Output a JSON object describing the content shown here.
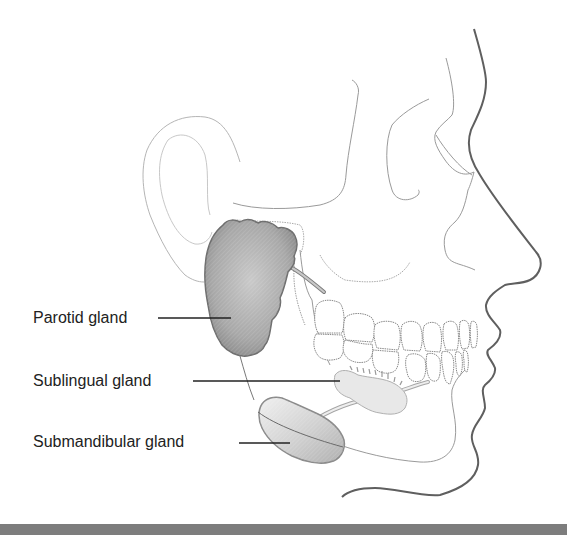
{
  "figure": {
    "labels": [
      {
        "id": "parotid",
        "text": "Parotid gland"
      },
      {
        "id": "sublingual",
        "text": "Sublingual gland"
      },
      {
        "id": "submandibular",
        "text": "Submandibular gland"
      }
    ]
  },
  "colors": {
    "outline": "#8a8a8a",
    "face_profile": "#5a5a5a",
    "gland_dark": "#8f8f8f",
    "gland_light": "#d8d8d8",
    "leader_line": "#222222",
    "bottom_bar": "#7d7d7d"
  }
}
